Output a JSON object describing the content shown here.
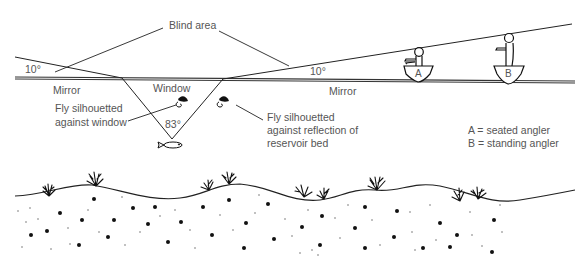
{
  "labels": {
    "blind_area": "Blind area",
    "angle_left": "10°",
    "angle_right": "10°",
    "mirror_left": "Mirror",
    "mirror_right": "Mirror",
    "window": "Window",
    "window_angle": "83°",
    "fly_window_line1": "Fly silhouetted",
    "fly_window_line2": "against window",
    "fly_reflection_line1": "Fly silhouetted",
    "fly_reflection_line2": "against reflection of",
    "fly_reflection_line3": "reservoir bed",
    "boat_a": "A",
    "boat_b": "B"
  },
  "legend": {
    "a": "A = seated angler",
    "b": "B = standing angler"
  },
  "caption": {
    "text": "",
    "note": "caption line clipped at bottom edge; text not legible"
  },
  "icons": [
    "fly-icon",
    "fish-icon",
    "seated-angler-icon",
    "standing-angler-icon",
    "weed-icon"
  ],
  "colors": {
    "line": "#222222",
    "text": "#555555",
    "background": "#ffffff"
  }
}
